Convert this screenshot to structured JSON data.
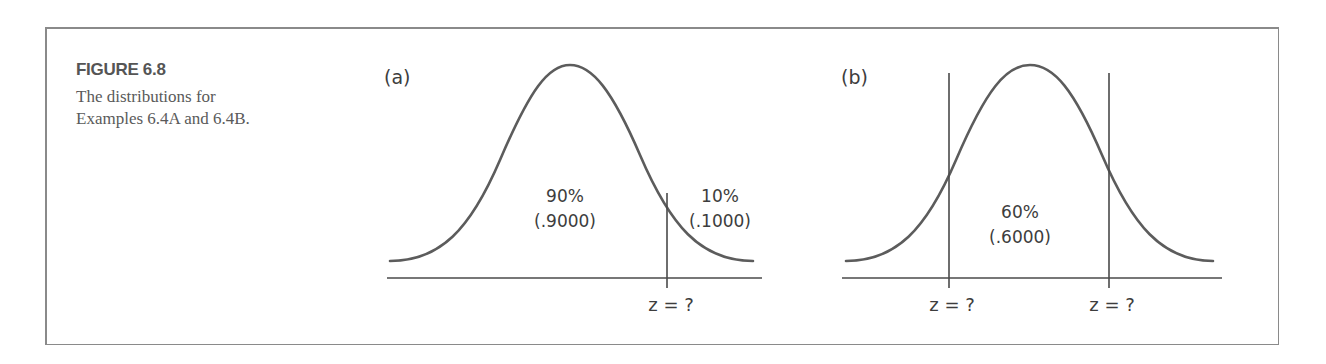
{
  "figure": {
    "label": "FIGURE 6.8",
    "caption_line1": "The distributions for",
    "caption_line2": "Examples 6.4A and 6.4B."
  },
  "panels": [
    {
      "id": "a",
      "tag": "(a)",
      "regions": [
        {
          "percent": "90%",
          "proportion": "(.9000)"
        },
        {
          "percent": "10%",
          "proportion": "(.1000)"
        }
      ],
      "cutoffs": [
        {
          "label": "z = ?"
        }
      ]
    },
    {
      "id": "b",
      "tag": "(b)",
      "regions": [
        {
          "percent": "60%",
          "proportion": "(.6000)"
        }
      ],
      "cutoffs": [
        {
          "label": "z = ?"
        },
        {
          "label": "z = ?"
        }
      ]
    }
  ],
  "colors": {
    "curve": "#5c5c5c",
    "axis": "#4a4a4a",
    "frame": "#8a8a8a",
    "text": "#3d3d3d"
  }
}
